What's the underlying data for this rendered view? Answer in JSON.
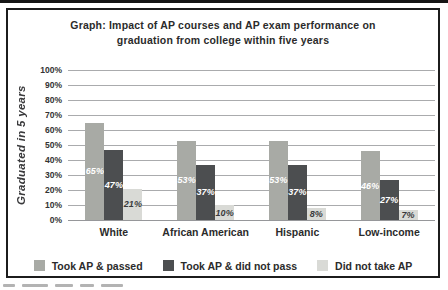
{
  "page": {
    "background": "#ffffff",
    "top_rule_color": "#151515",
    "panel_border_color": "#1c1c1c"
  },
  "chart_data": {
    "type": "bar",
    "title_line1": "Graph: Impact of AP courses and AP exam performance on",
    "title_line2": "graduation from college within five years",
    "ylabel": "Graduated in 5 years",
    "xlabel": "",
    "ylim": [
      0,
      100
    ],
    "ytick_labels": [
      "100%",
      "90%",
      "80%",
      "70%",
      "60%",
      "50%",
      "40%",
      "30%",
      "20%",
      "10%",
      "0%"
    ],
    "grid": true,
    "legend_position": "bottom",
    "categories": [
      "White",
      "African American",
      "Hispanic",
      "Low-income"
    ],
    "series": [
      {
        "name": "Took AP & passed",
        "color": "#a8aaa5",
        "label_color": "#ffffff",
        "values": [
          65,
          53,
          53,
          46
        ]
      },
      {
        "name": "Took AP & did not pass",
        "color": "#4c4e50",
        "label_color": "#ffffff",
        "values": [
          47,
          37,
          37,
          27
        ]
      },
      {
        "name": "Did not take AP",
        "color": "#d9dad6",
        "label_color": "#3a3a3c",
        "values": [
          21,
          10,
          8,
          7
        ]
      }
    ],
    "bar_label_suffix": "%"
  }
}
